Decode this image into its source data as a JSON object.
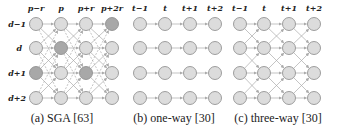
{
  "panels": [
    {
      "id": "a",
      "caption": "(a) SGA [63]",
      "col_labels": [
        "p−r",
        "p",
        "p+r",
        "p+2r"
      ],
      "row_labels": [
        "d−1",
        "d",
        "d+1",
        "d+2"
      ],
      "highlighted_nodes": [
        [
          0,
          3
        ],
        [
          1,
          1
        ],
        [
          2,
          0
        ],
        [
          2,
          2
        ]
      ]
    },
    {
      "id": "b",
      "caption": "(b) one-way [30]",
      "col_labels": [
        "t−1",
        "t",
        "t+1",
        "t+2"
      ]
    },
    {
      "id": "c",
      "caption": "(c) three-way [30]",
      "col_labels": [
        "t−1",
        "t",
        "t+1",
        "t+2"
      ]
    }
  ],
  "colors": {
    "node_fill": "#dcdcdc",
    "node_highlight": "#a8a8a8",
    "node_stroke": "#888888",
    "edge": "#aaaaaa"
  }
}
